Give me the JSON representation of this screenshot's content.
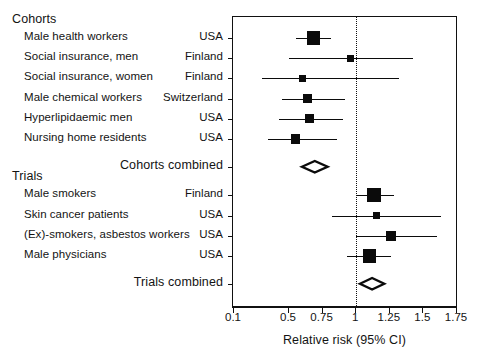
{
  "chart_data": {
    "type": "forest",
    "title": "",
    "xlabel": "Relative risk (95% CI)",
    "ylabel": "",
    "xticks": [
      0.1,
      0.5,
      0.75,
      1,
      1.25,
      1.5,
      1.75
    ],
    "xticklabels": [
      "0.1",
      "0.5",
      "0.75",
      "1",
      "1.25",
      "1.5",
      "1.75"
    ],
    "xlim": [
      0.1,
      1.75
    ],
    "null_value": 1,
    "axis_note": "broken axis: 0.1 then linear 0.5-1.75",
    "grid": false,
    "legend": "none",
    "groups": [
      {
        "name": "Cohorts",
        "studies": [
          {
            "label": "Male health workers",
            "country": "USA",
            "estimate": 0.68,
            "ci_low": 0.55,
            "ci_high": 0.81,
            "weight": 4.2
          },
          {
            "label": "Social insurance, men",
            "country": "Finland",
            "estimate": 0.96,
            "ci_low": 0.5,
            "ci_high": 1.42,
            "weight": 1.6
          },
          {
            "label": "Social insurance, women",
            "country": "Finland",
            "estimate": 0.6,
            "ci_low": 0.3,
            "ci_high": 1.32,
            "weight": 1.6
          },
          {
            "label": "Male chemical workers",
            "country": "Switzerland",
            "estimate": 0.64,
            "ci_low": 0.45,
            "ci_high": 0.92,
            "weight": 2.6
          },
          {
            "label": "Hyperlipidaemic men",
            "country": "USA",
            "estimate": 0.65,
            "ci_low": 0.43,
            "ci_high": 0.9,
            "weight": 2.6
          },
          {
            "label": "Nursing home residents",
            "country": "USA",
            "estimate": 0.55,
            "ci_low": 0.35,
            "ci_high": 0.86,
            "weight": 2.6
          }
        ],
        "combined": {
          "label": "Cohorts combined",
          "estimate": 0.69,
          "ci_low": 0.6,
          "ci_high": 0.79
        }
      },
      {
        "name": "Trials",
        "studies": [
          {
            "label": "Male smokers",
            "country": "Finland",
            "estimate": 1.13,
            "ci_low": 1.0,
            "ci_high": 1.28,
            "weight": 4.6
          },
          {
            "label": "Skin cancer patients",
            "country": "USA",
            "estimate": 1.15,
            "ci_low": 0.82,
            "ci_high": 1.63,
            "weight": 1.8
          },
          {
            "label": "(Ex)-smokers, asbestos workers",
            "country": "USA",
            "estimate": 1.26,
            "ci_low": 1.0,
            "ci_high": 1.6,
            "weight": 2.8
          },
          {
            "label": "Male physicians",
            "country": "USA",
            "estimate": 1.1,
            "ci_low": 0.93,
            "ci_high": 1.26,
            "weight": 4.2
          }
        ],
        "combined": {
          "label": "Trials combined",
          "estimate": 1.12,
          "ci_low": 1.03,
          "ci_high": 1.21
        }
      }
    ],
    "colors": {
      "marker": "#0b0b0b",
      "axis": "#111111",
      "text": "#131313",
      "background": "#ffffff"
    }
  }
}
